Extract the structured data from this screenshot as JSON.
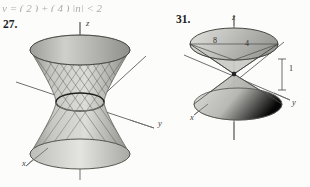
{
  "page": {
    "cut_line_fragment": "y = ( 2 )  + ( 4 )      |n| < 2",
    "background_color": "#fcfcfa"
  },
  "problems": [
    {
      "number": "27.",
      "figure_name": "hyperboloid-of-one-sheet",
      "surface_type": "hyperboloid of one sheet (ruled surface)",
      "axes": [
        {
          "name": "z",
          "label": "z",
          "direction": "vertical-up"
        },
        {
          "name": "y",
          "label": "y",
          "direction": "right-down"
        },
        {
          "name": "x",
          "label": "x",
          "direction": "left-down"
        }
      ],
      "annotations": []
    },
    {
      "number": "31.",
      "figure_name": "double-cone",
      "surface_type": "elliptic double cone",
      "axes": [
        {
          "name": "z",
          "label": "z",
          "direction": "vertical-up"
        },
        {
          "name": "y",
          "label": "y",
          "direction": "right-down"
        },
        {
          "name": "x",
          "label": "x",
          "direction": "left-down"
        }
      ],
      "annotations": [
        {
          "name": "semi-axis-8",
          "label": "8"
        },
        {
          "name": "semi-axis-4",
          "label": "4"
        },
        {
          "name": "height-1",
          "label": "1"
        }
      ]
    }
  ],
  "colors": {
    "ink": "#2a2a2a",
    "axis": "#6f6f6f",
    "surface_light": "#d9d9d6",
    "surface_mid": "#b4b4b0",
    "surface_dark": "#8e8e8a",
    "ruling": "#5a5a56"
  }
}
